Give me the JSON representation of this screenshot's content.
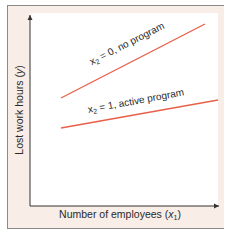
{
  "chart_data": {
    "type": "line",
    "title": "",
    "xlabel": "Number of employees (x1)",
    "ylabel": "Lost work hours (y)",
    "xlabel_parts": {
      "main": "Number of employees (",
      "var": "x",
      "sub": "1",
      "close": ")"
    },
    "ylabel_parts": {
      "main": "Lost work hours (",
      "var": "y",
      "close": ")"
    },
    "grid": false,
    "ticks": false,
    "axis_arrows": true,
    "series": [
      {
        "name": "x2 = 0, no program",
        "label_parts": {
          "var": "x",
          "sub": "2",
          "rest": " = 0, no program"
        },
        "color": "#e8604a",
        "points": [
          [
            61,
            98
          ],
          [
            205,
            24
          ]
        ]
      },
      {
        "name": "x2 = 1, active program",
        "label_parts": {
          "var": "x",
          "sub": "2",
          "rest": " = 1, active program"
        },
        "color": "#e8604a",
        "points": [
          [
            61,
            128
          ],
          [
            218,
            100
          ]
        ]
      }
    ]
  },
  "colors": {
    "panel_bg": "#f8ede7",
    "plot_bg": "#ffffff",
    "line": "#e8604a",
    "axis": "#333333",
    "border": "#8a8a8a"
  }
}
